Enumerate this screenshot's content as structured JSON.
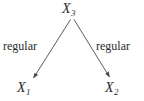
{
  "diagram": {
    "type": "directed-acyclic-graph",
    "background_color": "#ffffff",
    "stroke_color": "#4a4a4a",
    "text_color": "#2b2b2b",
    "nodes": [
      {
        "id": "x3",
        "base": "X",
        "subscript": "3",
        "label": "X3",
        "x": 72,
        "y": 10
      },
      {
        "id": "x1",
        "base": "X",
        "subscript": "1",
        "label": "X1",
        "x": 26,
        "y": 88
      },
      {
        "id": "x2",
        "base": "X",
        "subscript": "2",
        "label": "X2",
        "x": 114,
        "y": 88
      }
    ],
    "edges": [
      {
        "id": "edge-x3-x1",
        "from": "x3",
        "to": "x1",
        "label": "regular",
        "arrowhead": true
      },
      {
        "id": "edge-x3-x2",
        "from": "x3",
        "to": "x2",
        "label": "regular",
        "arrowhead": true
      }
    ],
    "edge_labels": {
      "left": "regular",
      "right": "regular"
    }
  }
}
